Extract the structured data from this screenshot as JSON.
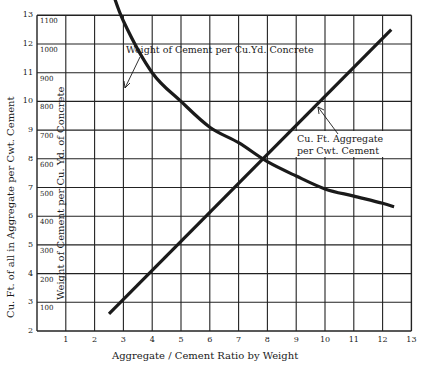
{
  "chart_data": {
    "type": "line",
    "title": "",
    "xlabel": "Aggregate / Cement Ratio by Weight",
    "ylabel": "Cu. Ft. of all in Aggregate per Cwt. Cement",
    "y2label": "Weight of Cement per Cu. Yd. of Concrete",
    "xlim": [
      0,
      13
    ],
    "ylim": [
      2,
      13
    ],
    "y2lim": [
      0,
      1100
    ],
    "grid": true,
    "x_ticks": [
      1,
      2,
      3,
      4,
      5,
      6,
      7,
      8,
      9,
      10,
      11,
      12,
      13
    ],
    "y_ticks": [
      2,
      3,
      4,
      5,
      6,
      7,
      8,
      9,
      10,
      11,
      12,
      13
    ],
    "y2_ticks": [
      100,
      200,
      300,
      400,
      500,
      600,
      700,
      800,
      900,
      1000,
      1100
    ],
    "series": [
      {
        "name": "Weight of Cement per Cu.Yd. Concrete",
        "axis": "y2",
        "x": [
          2.5,
          3,
          4,
          5,
          6,
          7,
          8,
          9,
          10,
          11,
          12,
          12.4
        ],
        "values": [
          1220,
          1080,
          900,
          800,
          710,
          656,
          590,
          540,
          495,
          470,
          445,
          433
        ]
      },
      {
        "name": "Cu.Ft. Aggregate per Cwt. Cement",
        "axis": "y",
        "x": [
          2.5,
          12.3
        ],
        "values": [
          2.6,
          12.5
        ]
      }
    ],
    "annotations": [
      {
        "text": "Weight of Cement per Cu.Yd. Concrete",
        "arrow_to": [
          3.6,
          1040
        ]
      },
      {
        "text": "Cu.Ft. Aggregate per Cwt. Cement",
        "arrow_to": [
          9.8,
          10.1
        ]
      }
    ]
  },
  "labels": {
    "xlabel": "Aggregate / Cement Ratio by Weight",
    "ylabel": "Cu. Ft. of all in Aggregate per Cwt. Cement",
    "y2label": "Weight of Cement per Cu. Yd. of Concrete",
    "cement_curve_line1": "Weight of Cement per Cu.Yd. Concrete",
    "aggregate_line1": "Cu. Ft. Aggregate",
    "aggregate_line2": "per Cwt. Cement"
  },
  "style": {
    "ink": "#1a1a1a",
    "grid": "#222222",
    "background": "#ffffff"
  }
}
